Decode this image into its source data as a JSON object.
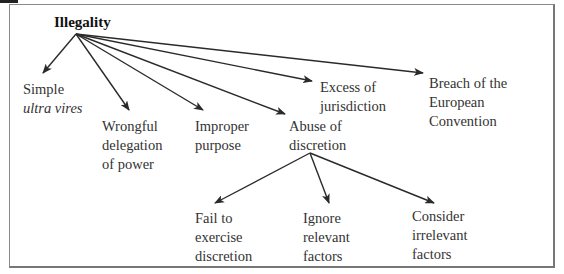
{
  "diagram": {
    "root": {
      "label": "Illegality"
    },
    "branches": [
      {
        "id": "simple",
        "lines": [
          "Simple",
          "ultra vires"
        ],
        "italic_line": 1
      },
      {
        "id": "wrongful",
        "lines": [
          "Wrongful",
          "delegation",
          "of power"
        ]
      },
      {
        "id": "improper",
        "lines": [
          "Improper",
          "purpose"
        ]
      },
      {
        "id": "abuse",
        "lines": [
          "Abuse of",
          "discretion"
        ]
      },
      {
        "id": "excess",
        "lines": [
          "Excess of",
          "jurisdiction"
        ]
      },
      {
        "id": "breach",
        "lines": [
          "Breach of the",
          "European",
          "Convention"
        ]
      }
    ],
    "sub_branches": {
      "parent": "abuse",
      "children": [
        {
          "id": "fail",
          "lines": [
            "Fail to",
            "exercise",
            "discretion"
          ]
        },
        {
          "id": "ignore",
          "lines": [
            "Ignore",
            "relevant",
            "factors"
          ]
        },
        {
          "id": "consider",
          "lines": [
            "Consider",
            "irrelevant",
            "factors"
          ]
        }
      ]
    },
    "colors": {
      "line": "#2a2a2a",
      "frame": "#8a8a8a",
      "text": "#333333"
    }
  }
}
